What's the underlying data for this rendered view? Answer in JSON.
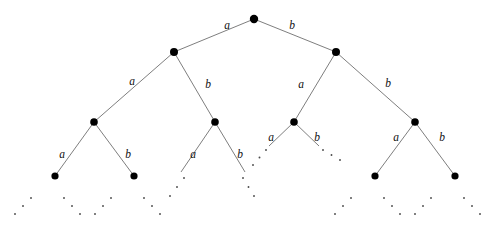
{
  "figure": {
    "kind": "binary-tree-diagram",
    "background_color": "#ffffff",
    "line_color": "#6f6f6f",
    "node_color": "#000000",
    "label_color": "#111111",
    "ellipsis_color": "#4a4a4a",
    "label_alphabet": [
      "a",
      "b"
    ],
    "depth_levels": 5,
    "canvas": {
      "width": 502,
      "height": 227
    }
  },
  "nodes": [
    {
      "id": "root",
      "label": "",
      "x": 254,
      "y": 19,
      "r": 4.2,
      "level": 0
    },
    {
      "id": "a",
      "label": "",
      "x": 174,
      "y": 52,
      "r": 4.0,
      "level": 1
    },
    {
      "id": "b",
      "label": "",
      "x": 336,
      "y": 52,
      "r": 4.0,
      "level": 1
    },
    {
      "id": "aa",
      "label": "",
      "x": 94,
      "y": 122,
      "r": 3.8,
      "level": 2
    },
    {
      "id": "ab",
      "label": "",
      "x": 215,
      "y": 122,
      "r": 3.8,
      "level": 2
    },
    {
      "id": "ba",
      "label": "",
      "x": 294,
      "y": 122,
      "r": 3.8,
      "level": 2
    },
    {
      "id": "bb",
      "label": "",
      "x": 415,
      "y": 122,
      "r": 3.8,
      "level": 2
    },
    {
      "id": "aaa",
      "label": "",
      "x": 55,
      "y": 176,
      "r": 3.6,
      "level": 3
    },
    {
      "id": "aab",
      "label": "",
      "x": 134,
      "y": 176,
      "r": 3.6,
      "level": 3
    },
    {
      "id": "bba",
      "label": "",
      "x": 375,
      "y": 176,
      "r": 3.6,
      "level": 3
    },
    {
      "id": "bbb",
      "label": "",
      "x": 455,
      "y": 176,
      "r": 3.6,
      "level": 3
    }
  ],
  "edges": [
    {
      "from": "root",
      "to": "a",
      "label": "a",
      "x1": 254,
      "y1": 19,
      "x2": 174,
      "y2": 52
    },
    {
      "from": "root",
      "to": "b",
      "label": "b",
      "x1": 254,
      "y1": 19,
      "x2": 336,
      "y2": 52
    },
    {
      "from": "a",
      "to": "aa",
      "label": "a",
      "x1": 174,
      "y1": 52,
      "x2": 94,
      "y2": 122
    },
    {
      "from": "a",
      "to": "ab",
      "label": "b",
      "x1": 174,
      "y1": 52,
      "x2": 215,
      "y2": 122
    },
    {
      "from": "b",
      "to": "ba",
      "label": "a",
      "x1": 336,
      "y1": 52,
      "x2": 294,
      "y2": 122
    },
    {
      "from": "b",
      "to": "bb",
      "label": "b",
      "x1": 336,
      "y1": 52,
      "x2": 415,
      "y2": 122
    },
    {
      "from": "aa",
      "to": "aaa",
      "label": "a",
      "x1": 94,
      "y1": 122,
      "x2": 55,
      "y2": 176
    },
    {
      "from": "aa",
      "to": "aab",
      "label": "b",
      "x1": 94,
      "y1": 122,
      "x2": 134,
      "y2": 176
    },
    {
      "from": "bb",
      "to": "bba",
      "label": "a",
      "x1": 415,
      "y1": 122,
      "x2": 375,
      "y2": 176
    },
    {
      "from": "bb",
      "to": "bbb",
      "label": "b",
      "x1": 415,
      "y1": 122,
      "x2": 455,
      "y2": 176
    }
  ],
  "truncated_edges": [
    {
      "from": "ab",
      "label": "a",
      "x1": 215,
      "y1": 122,
      "x2": 181,
      "y2": 172
    },
    {
      "from": "ab",
      "label": "b",
      "x1": 215,
      "y1": 122,
      "x2": 245,
      "y2": 172
    },
    {
      "from": "ba",
      "label": "a",
      "x1": 294,
      "y1": 122,
      "x2": 269,
      "y2": 146
    },
    {
      "from": "ba",
      "label": "b",
      "x1": 294,
      "y1": 122,
      "x2": 319,
      "y2": 146
    }
  ],
  "edge_labels": [
    {
      "text": "a",
      "x": 227,
      "y": 26,
      "edge": "root-a"
    },
    {
      "text": "b",
      "x": 292,
      "y": 26,
      "edge": "root-b"
    },
    {
      "text": "a",
      "x": 132,
      "y": 82,
      "edge": "a-aa"
    },
    {
      "text": "b",
      "x": 208,
      "y": 85,
      "edge": "a-ab"
    },
    {
      "text": "a",
      "x": 301,
      "y": 85,
      "edge": "b-ba"
    },
    {
      "text": "b",
      "x": 388,
      "y": 84,
      "edge": "b-bb"
    },
    {
      "text": "a",
      "x": 62,
      "y": 155,
      "edge": "aa-aaa"
    },
    {
      "text": "b",
      "x": 128,
      "y": 155,
      "edge": "aa-aab"
    },
    {
      "text": "a",
      "x": 193,
      "y": 155,
      "edge": "ab-dots-a"
    },
    {
      "text": "b",
      "x": 240,
      "y": 155,
      "edge": "ab-dots-b"
    },
    {
      "text": "a",
      "x": 271,
      "y": 138,
      "edge": "ba-dots-a"
    },
    {
      "text": "b",
      "x": 317,
      "y": 138,
      "edge": "ba-dots-b"
    },
    {
      "text": "a",
      "x": 396,
      "y": 138,
      "edge": "bb-bba"
    },
    {
      "text": "b",
      "x": 442,
      "y": 138,
      "edge": "bb-bbb"
    }
  ],
  "ellipses": [
    {
      "id": "ellipsis-aaa-left",
      "x1": 31,
      "y1": 198,
      "x2": 15,
      "y2": 214,
      "dots": 3
    },
    {
      "id": "ellipsis-aaa-right",
      "x1": 64,
      "y1": 198,
      "x2": 80,
      "y2": 214,
      "dots": 3
    },
    {
      "id": "ellipsis-aab-left",
      "x1": 111,
      "y1": 198,
      "x2": 95,
      "y2": 214,
      "dots": 3
    },
    {
      "id": "ellipsis-aab-right",
      "x1": 144,
      "y1": 198,
      "x2": 160,
      "y2": 214,
      "dots": 3
    },
    {
      "id": "ellipsis-ab-left",
      "x1": 184,
      "y1": 178,
      "x2": 170,
      "y2": 196,
      "dots": 3
    },
    {
      "id": "ellipsis-ab-right",
      "x1": 243,
      "y1": 178,
      "x2": 254,
      "y2": 196,
      "dots": 3
    },
    {
      "id": "ellipsis-ba-left",
      "x1": 266,
      "y1": 150,
      "x2": 253,
      "y2": 165,
      "dots": 3
    },
    {
      "id": "ellipsis-ba-right",
      "x1": 323,
      "y1": 150,
      "x2": 340,
      "y2": 160,
      "dots": 3
    },
    {
      "id": "ellipsis-bba-left",
      "x1": 351,
      "y1": 198,
      "x2": 335,
      "y2": 214,
      "dots": 3
    },
    {
      "id": "ellipsis-bba-right",
      "x1": 384,
      "y1": 198,
      "x2": 400,
      "y2": 214,
      "dots": 3
    },
    {
      "id": "ellipsis-bbb-left",
      "x1": 431,
      "y1": 198,
      "x2": 415,
      "y2": 214,
      "dots": 3
    },
    {
      "id": "ellipsis-bbb-right",
      "x1": 464,
      "y1": 198,
      "x2": 480,
      "y2": 214,
      "dots": 3
    }
  ]
}
